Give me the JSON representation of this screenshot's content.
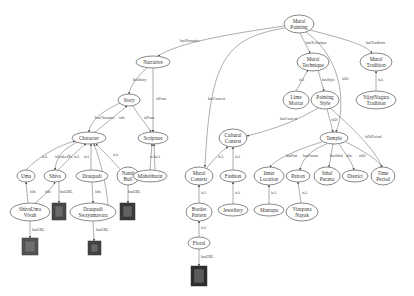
{
  "diagram": {
    "type": "knowledge-graph",
    "nodes": [
      {
        "id": "mural_painting",
        "lines": [
          "Mural",
          "Painting"
        ],
        "x": 299,
        "y": 24,
        "rx": 15,
        "ry": 9
      },
      {
        "id": "narrative",
        "lines": [
          "Narrative"
        ],
        "x": 153,
        "y": 62,
        "rx": 17,
        "ry": 6
      },
      {
        "id": "mural_technique",
        "lines": [
          "Mural",
          "Technique"
        ],
        "x": 313,
        "y": 62,
        "rx": 16,
        "ry": 9
      },
      {
        "id": "mural_tradition",
        "lines": [
          "Mural",
          "Tradition"
        ],
        "x": 376,
        "y": 62,
        "rx": 16,
        "ry": 9
      },
      {
        "id": "story",
        "lines": [
          "Story"
        ],
        "x": 129,
        "y": 100,
        "rx": 11,
        "ry": 6
      },
      {
        "id": "lime_mortar",
        "lines": [
          "Lime",
          "Mortar"
        ],
        "x": 296,
        "y": 100,
        "rx": 13,
        "ry": 9
      },
      {
        "id": "painting_style",
        "lines": [
          "Painting",
          "Style"
        ],
        "x": 325,
        "y": 100,
        "rx": 14,
        "ry": 9
      },
      {
        "id": "vijaynagara_tradition",
        "lines": [
          "VijayNagara",
          "Tradition"
        ],
        "x": 376,
        "y": 100,
        "rx": 20,
        "ry": 9
      },
      {
        "id": "character",
        "lines": [
          "Character"
        ],
        "x": 89,
        "y": 138,
        "rx": 17,
        "ry": 6
      },
      {
        "id": "scripture",
        "lines": [
          "Scripture"
        ],
        "x": 153,
        "y": 138,
        "rx": 15,
        "ry": 6
      },
      {
        "id": "cultural_context",
        "lines": [
          "Cultural",
          "Context"
        ],
        "x": 233,
        "y": 138,
        "rx": 14,
        "ry": 9
      },
      {
        "id": "temple",
        "lines": [
          "Temple"
        ],
        "x": 334,
        "y": 138,
        "rx": 14,
        "ry": 6
      },
      {
        "id": "uma",
        "lines": [
          "Uma"
        ],
        "x": 26,
        "y": 176,
        "rx": 9,
        "ry": 6
      },
      {
        "id": "shiva",
        "lines": [
          "Shiva"
        ],
        "x": 55,
        "y": 176,
        "rx": 11,
        "ry": 6
      },
      {
        "id": "draupadi",
        "lines": [
          "Draupadi"
        ],
        "x": 92,
        "y": 176,
        "rx": 16,
        "ry": 6
      },
      {
        "id": "nandi_bull",
        "lines": [
          "Nandi",
          "Bull"
        ],
        "x": 128,
        "y": 176,
        "rx": 11,
        "ry": 9
      },
      {
        "id": "mahabharat",
        "lines": [
          "Mahabharat"
        ],
        "x": 150,
        "y": 176,
        "rx": 17,
        "ry": 6
      },
      {
        "id": "mural_context",
        "lines": [
          "Mural",
          "Context"
        ],
        "x": 199,
        "y": 176,
        "rx": 14,
        "ry": 9
      },
      {
        "id": "fashion",
        "lines": [
          "Fashion"
        ],
        "x": 233,
        "y": 176,
        "rx": 13,
        "ry": 6
      },
      {
        "id": "inner_location",
        "lines": [
          "Inner",
          "Location"
        ],
        "x": 269,
        "y": 176,
        "rx": 15,
        "ry": 9
      },
      {
        "id": "patron",
        "lines": [
          "Patron"
        ],
        "x": 298,
        "y": 176,
        "rx": 12,
        "ry": 6
      },
      {
        "id": "sthal_purana",
        "lines": [
          "Sthal",
          "Purana"
        ],
        "x": 327,
        "y": 176,
        "rx": 13,
        "ry": 9
      },
      {
        "id": "district",
        "lines": [
          "District"
        ],
        "x": 355,
        "y": 176,
        "rx": 13,
        "ry": 6
      },
      {
        "id": "time_period",
        "lines": [
          "Time",
          "Period"
        ],
        "x": 383,
        "y": 176,
        "rx": 12,
        "ry": 9
      },
      {
        "id": "shivauma_vivah",
        "lines": [
          "ShivaUma",
          "Vivah"
        ],
        "x": 30,
        "y": 212,
        "rx": 20,
        "ry": 9
      },
      {
        "id": "draupadi_swayamavara",
        "lines": [
          "Draupadi",
          "Swayamavara"
        ],
        "x": 93,
        "y": 212,
        "rx": 23,
        "ry": 9
      },
      {
        "id": "border_pattern",
        "lines": [
          "Border",
          "Pattern"
        ],
        "x": 199,
        "y": 212,
        "rx": 13,
        "ry": 9
      },
      {
        "id": "jewellery",
        "lines": [
          "Jewellery"
        ],
        "x": 233,
        "y": 210,
        "rx": 15,
        "ry": 6
      },
      {
        "id": "mantapa",
        "lines": [
          "Mantapa"
        ],
        "x": 269,
        "y": 210,
        "rx": 15,
        "ry": 6
      },
      {
        "id": "virupana_nayak",
        "lines": [
          "Virupana",
          "Nayak"
        ],
        "x": 302,
        "y": 212,
        "rx": 16,
        "ry": 9
      },
      {
        "id": "floral",
        "lines": [
          "Floral"
        ],
        "x": 199,
        "y": 243,
        "rx": 11,
        "ry": 6
      }
    ],
    "images": [
      {
        "id": "img_shiva",
        "x": 52,
        "y": 203,
        "w": 14,
        "h": 17,
        "color": "#4a4a4a"
      },
      {
        "id": "img_nandi",
        "x": 120,
        "y": 203,
        "w": 15,
        "h": 17,
        "color": "#3a3a3a"
      },
      {
        "id": "img_shivauma",
        "x": 22,
        "y": 238,
        "w": 16,
        "h": 17,
        "color": "#555555"
      },
      {
        "id": "img_draupadi",
        "x": 88,
        "y": 241,
        "w": 13,
        "h": 14,
        "color": "#444444"
      },
      {
        "id": "img_floral",
        "x": 191,
        "y": 266,
        "w": 16,
        "h": 20,
        "color": "#2e2e2e"
      }
    ],
    "edges": [
      {
        "label": "hasNarrative",
        "d": "M284,26 C230,34 180,42 158,56",
        "lx": 180,
        "ly": 42
      },
      {
        "label": "hasTechnique",
        "d": "M300,33 L310,53",
        "lx": 306,
        "ly": 44
      },
      {
        "label": "hasTradition",
        "d": "M310,30 C340,38 365,44 372,53",
        "lx": 366,
        "ly": 44
      },
      {
        "label": "hasContext",
        "d": "M285,28 C225,38 210,60 205,167",
        "lx": 208,
        "ly": 100
      },
      {
        "label": "isOf",
        "d": "M306,32 C345,60 345,110 336,132",
        "lx": 342,
        "ly": 80
      },
      {
        "label": "hasStory",
        "d": "M147,68 C135,78 130,88 129,94",
        "lx": 133,
        "ly": 81
      },
      {
        "label": "isProse",
        "d": "M153,68 L153,132",
        "lx": 156,
        "ly": 100
      },
      {
        "label": "isA",
        "d": "M296,91 L308,70",
        "lx": 299,
        "ly": 81
      },
      {
        "label": "hasStyle",
        "d": "M318,70 L324,91",
        "lx": 322,
        "ly": 81
      },
      {
        "label": "isA",
        "d": "M376,91 L376,71",
        "lx": 378,
        "ly": 81
      },
      {
        "label": "hasContext",
        "d": "M318,108 C290,125 262,132 247,136",
        "lx": 280,
        "ly": 120
      },
      {
        "label": "isOf",
        "d": "M327,109 L333,132",
        "lx": 331,
        "ly": 121
      },
      {
        "label": "isOfPeriod",
        "d": "M330,108 C355,130 375,150 382,167",
        "lx": 365,
        "ly": 138
      },
      {
        "label": "hasCharacter",
        "d": "M120,103 C100,112 90,122 89,132",
        "lx": 95,
        "ly": 119
      },
      {
        "label": "isIn",
        "d": "M95,132 C110,120 122,110 127,106",
        "lx": 119,
        "ly": 119
      },
      {
        "label": "isProse",
        "d": "M133,106 C140,118 148,126 151,132",
        "lx": 144,
        "ly": 119
      },
      {
        "label": "isA",
        "d": "M26,170 C40,155 60,145 75,141",
        "lx": 42,
        "ly": 158
      },
      {
        "label": "isLinkedTo",
        "d": "M78,142 C60,150 56,160 55,170",
        "lx": 55,
        "ly": 158
      },
      {
        "label": "isA",
        "d": "M58,170 C70,158 80,148 86,144",
        "lx": 74,
        "ly": 158
      },
      {
        "label": "isA",
        "d": "M91,170 L91,144",
        "lx": 84,
        "ly": 158
      },
      {
        "label": "isA",
        "d": "M120,169 C110,158 100,148 96,144",
        "lx": 113,
        "ly": 156
      },
      {
        "label": "isA",
        "d": "M108,205 C106,180 98,155 94,144",
        "lx": 102,
        "ly": 178
      },
      {
        "label": "isA",
        "d": "M150,170 L152,144",
        "lx": 150,
        "ly": 158
      },
      {
        "label": "isA",
        "d": "M155,170 L154,144",
        "lx": 155,
        "ly": 158
      },
      {
        "label": "isA",
        "d": "M206,169 C215,158 222,150 228,147",
        "lx": 218,
        "ly": 158
      },
      {
        "label": "isA",
        "d": "M233,170 L233,147",
        "lx": 235,
        "ly": 158
      },
      {
        "label": "hasPart",
        "d": "M322,142 C295,150 275,160 270,167",
        "lx": 286,
        "ly": 157
      },
      {
        "label": "hasPatron",
        "d": "M327,144 C310,150 302,160 300,170",
        "lx": 303,
        "ly": 157
      },
      {
        "label": "hasSthal",
        "d": "M333,144 L329,167",
        "lx": 330,
        "ly": 157
      },
      {
        "label": "isIn",
        "d": "M339,144 C346,155 352,162 354,170",
        "lx": 346,
        "ly": 157
      },
      {
        "label": "isOf",
        "d": "M346,142 C365,152 378,160 382,167",
        "lx": 359,
        "ly": 157
      },
      {
        "label": "isIn",
        "d": "M28,203 L26,182",
        "lx": 30,
        "ly": 193
      },
      {
        "label": "isIn",
        "d": "M35,203 C45,195 52,188 55,182",
        "lx": 45,
        "ly": 193
      },
      {
        "label": "hasURL",
        "d": "M59,182 L59,203",
        "lx": 60,
        "ly": 193
      },
      {
        "label": "isIn",
        "d": "M92,182 L93,203",
        "lx": 95,
        "ly": 193
      },
      {
        "label": "hasURL",
        "d": "M128,185 L128,203",
        "lx": 128,
        "ly": 193
      },
      {
        "label": "isA",
        "d": "M199,203 L199,185",
        "lx": 201,
        "ly": 194
      },
      {
        "label": "isA",
        "d": "M233,204 L233,182",
        "lx": 235,
        "ly": 194
      },
      {
        "label": "isA",
        "d": "M269,204 L269,185",
        "lx": 271,
        "ly": 194
      },
      {
        "label": "isA",
        "d": "M301,203 L298,182",
        "lx": 302,
        "ly": 194
      },
      {
        "label": "isA",
        "d": "M199,237 L199,221",
        "lx": 201,
        "ly": 229
      },
      {
        "label": "hasURL",
        "d": "M30,221 L30,238",
        "lx": 32,
        "ly": 231
      },
      {
        "label": "hasURL",
        "d": "M93,221 L94,241",
        "lx": 96,
        "ly": 231
      },
      {
        "label": "hasURL",
        "d": "M199,249 L199,266",
        "lx": 201,
        "ly": 258
      }
    ]
  }
}
